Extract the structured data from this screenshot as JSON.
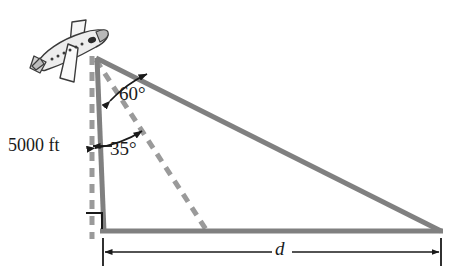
{
  "diagram": {
    "type": "trigonometry-right-triangle",
    "labels": {
      "altitude": "5000 ft",
      "angle_upper": "60°",
      "angle_lower": "35°",
      "distance": "d"
    },
    "icons": {
      "airplane": "airplane-icon"
    },
    "colors": {
      "line_gray": "#808080",
      "dash_gray": "#999999",
      "text_black": "#1a1a1a",
      "plane_outline": "#3a3a3a",
      "plane_fill": "#f2f2f2",
      "plane_shade": "#b8b8b8",
      "background": "#ffffff"
    },
    "geometry": {
      "apex": [
        97,
        58
      ],
      "base_left": [
        103,
        231
      ],
      "base_right": [
        441,
        231
      ],
      "dashed_vertical_top": [
        92,
        60
      ],
      "dashed_vertical_bottom": [
        92,
        237
      ],
      "dashed_ray_end": [
        206,
        231
      ],
      "angle_upper_value": 60,
      "angle_lower_value": 35,
      "right_angle_marker": true
    },
    "dimension": {
      "left_tick_x": 103,
      "right_tick_x": 441,
      "y": 252,
      "arrow_both_ends": true
    }
  }
}
